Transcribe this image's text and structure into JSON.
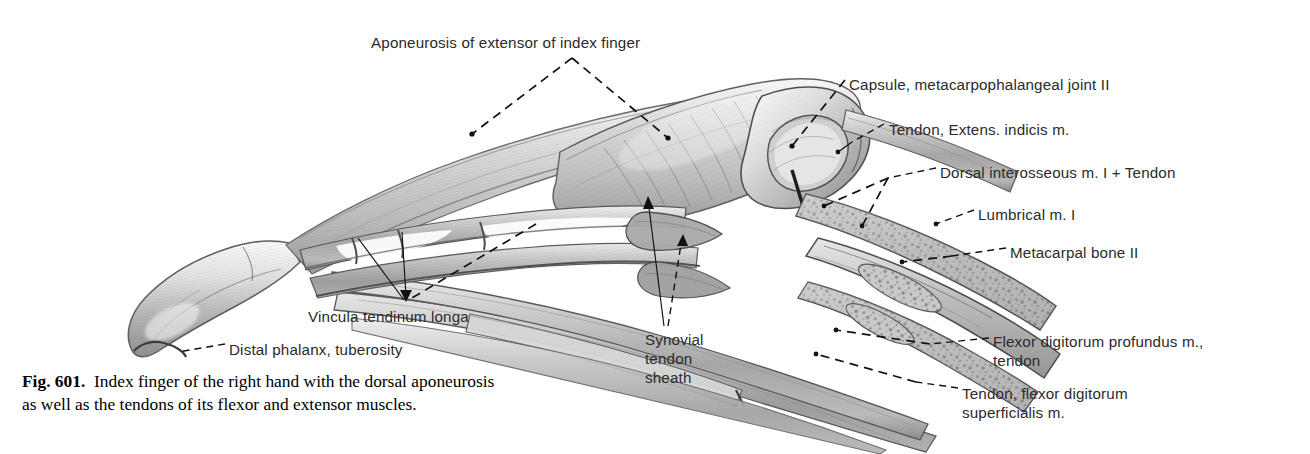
{
  "figure": {
    "number": "Fig. 601.",
    "caption_line1": "Index finger of the right hand with the dorsal aponeurosis",
    "caption_line2": "as well as the tendons of its flexor and extensor muscles.",
    "background_color": "#ffffff",
    "ink_color": "#2b2b2b"
  },
  "labels": [
    {
      "id": "aponeurosis-extensor-index",
      "text": "Aponeurosis of extensor of index finger",
      "x": 371,
      "y": 33,
      "align": "left"
    },
    {
      "id": "capsule-mcp-joint-2",
      "text": "Capsule, metacarpophalangeal joint II",
      "x": 849,
      "y": 75,
      "align": "left"
    },
    {
      "id": "tendon-extensor-indicis",
      "text": "Tendon, Extens. indicis m.",
      "x": 889,
      "y": 120,
      "align": "left"
    },
    {
      "id": "dorsal-interosseous-1-tendon",
      "text": "Dorsal interosseous m. I + Tendon",
      "x": 940,
      "y": 163,
      "align": "left"
    },
    {
      "id": "lumbrical-1",
      "text": "Lumbrical m. I",
      "x": 978,
      "y": 205,
      "align": "left"
    },
    {
      "id": "metacarpal-bone-2",
      "text": "Metacarpal bone II",
      "x": 1010,
      "y": 243,
      "align": "left"
    },
    {
      "id": "vincula-tendinum-longa",
      "text": "Vincula tendinum longa",
      "x": 308,
      "y": 307,
      "align": "left"
    },
    {
      "id": "distal-phalanx-tuberosity",
      "text": "Distal phalanx, tuberosity",
      "x": 229,
      "y": 340,
      "align": "left"
    },
    {
      "id": "synovial-tendon-sheath",
      "text": "Synovial\ntendon\nsheath",
      "x": 645,
      "y": 330,
      "align": "left",
      "multiline": true
    },
    {
      "id": "flexor-digitorum-profundus-tendon",
      "text": "Flexor digitorum profundus m.,\ntendon",
      "x": 993,
      "y": 332,
      "align": "left",
      "multiline": true
    },
    {
      "id": "tendon-flexor-digitorum-superficialis",
      "text": "Tendon, flexor digitorum\nsuperficialis m.",
      "x": 962,
      "y": 384,
      "align": "left",
      "multiline": true
    }
  ]
}
